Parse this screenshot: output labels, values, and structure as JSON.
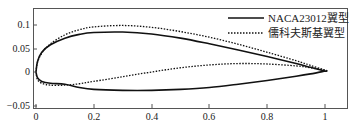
{
  "chart_data": {
    "type": "line",
    "title": "",
    "xlabel": "",
    "ylabel": "",
    "xlim": [
      0,
      1.02
    ],
    "ylim": [
      -0.055,
      0.125
    ],
    "grid": false,
    "legend_position": "upper right",
    "xticks": [
      "0",
      "0.2",
      "0.4",
      "0.6",
      "0.8",
      "1"
    ],
    "yticks": [
      "0.1",
      "0.05",
      "0",
      "-0.05"
    ],
    "series": [
      {
        "name": "NACA23012翼型",
        "style": "solid",
        "color": "#111111",
        "upper": {
          "x": [
            0,
            0.005,
            0.02,
            0.05,
            0.1,
            0.15,
            0.2,
            0.3,
            0.4,
            0.5,
            0.6,
            0.7,
            0.8,
            0.9,
            0.95,
            1.0
          ],
          "y": [
            0,
            0.022,
            0.042,
            0.058,
            0.072,
            0.08,
            0.084,
            0.085,
            0.081,
            0.072,
            0.06,
            0.047,
            0.033,
            0.018,
            0.01,
            0.002
          ]
        },
        "lower": {
          "x": [
            0,
            0.005,
            0.02,
            0.05,
            0.1,
            0.15,
            0.2,
            0.3,
            0.4,
            0.5,
            0.6,
            0.7,
            0.8,
            0.9,
            0.95,
            1.0
          ],
          "y": [
            0,
            -0.012,
            -0.02,
            -0.024,
            -0.026,
            -0.033,
            -0.037,
            -0.039,
            -0.039,
            -0.037,
            -0.033,
            -0.026,
            -0.018,
            -0.009,
            -0.004,
            0.002
          ]
        }
      },
      {
        "name": "儒科夫斯基翼型",
        "style": "dotted",
        "color": "#111111",
        "upper": {
          "x": [
            0,
            0.005,
            0.02,
            0.05,
            0.1,
            0.15,
            0.2,
            0.3,
            0.4,
            0.5,
            0.6,
            0.7,
            0.8,
            0.9,
            0.95,
            1.0
          ],
          "y": [
            0,
            0.02,
            0.04,
            0.06,
            0.079,
            0.09,
            0.096,
            0.099,
            0.095,
            0.086,
            0.074,
            0.059,
            0.042,
            0.024,
            0.014,
            0.004
          ]
        },
        "lower": {
          "x": [
            0,
            0.005,
            0.02,
            0.05,
            0.1,
            0.15,
            0.2,
            0.3,
            0.4,
            0.5,
            0.6,
            0.7,
            0.8,
            0.9,
            0.95,
            1.0
          ],
          "y": [
            0,
            -0.016,
            -0.024,
            -0.028,
            -0.028,
            -0.025,
            -0.02,
            -0.01,
            0.0,
            0.009,
            0.015,
            0.018,
            0.017,
            0.013,
            0.009,
            0.004
          ]
        }
      }
    ]
  },
  "legend": {
    "items": [
      {
        "label": "NACA23012翼型",
        "style": "solid"
      },
      {
        "label": "儒科夫斯基翼型",
        "style": "dotted"
      }
    ]
  },
  "axes": {
    "x_tick_labels": [
      "0",
      "0.2",
      "0.4",
      "0.6",
      "0.8",
      "1"
    ],
    "y_tick_labels": [
      "0.1",
      "0.05",
      "0",
      "−0.05"
    ]
  }
}
